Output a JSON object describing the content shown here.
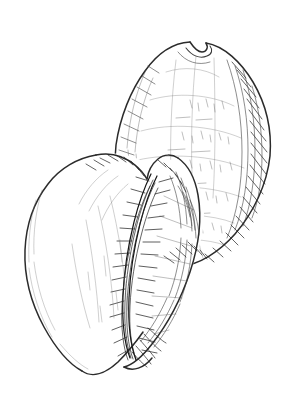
{
  "image": {
    "subject": "two cowrie shells",
    "medium": "pen and ink line drawing",
    "style": "hand-drawn cross-hatched scientific illustration",
    "background_color": "#ffffff",
    "ink_color": "#2b2b2b",
    "width": 293,
    "height": 408,
    "caption": "",
    "signature": ""
  },
  "objects": [
    {
      "name": "upper-shell",
      "label": "dorsal view cowrie shell",
      "position": "upper right",
      "orientation": "tilted, apex toward upper right",
      "features": [
        "notched apex at top",
        "ovate inflated body",
        "dense diagonal cross-hatching along right flank",
        "faint horizontal growth bands across dorsum",
        "narrowed base overlapping lower shell"
      ],
      "bounds": {
        "x": 112,
        "y": 38,
        "width": 162,
        "height": 232
      }
    },
    {
      "name": "lower-shell",
      "label": "ventral view cowrie shell",
      "position": "lower left",
      "orientation": "tilted, aperture facing upper right",
      "features": [
        "long curved aperture slit",
        "toothed denticles flanking the aperture",
        "smooth unmarked left lobe",
        "pointed anterior canal at base",
        "dark shaded columellar margin"
      ],
      "bounds": {
        "x": 22,
        "y": 150,
        "width": 170,
        "height": 230
      }
    }
  ],
  "composition": {
    "arrangement": "two overlapping shells, lower-left shell in front of upper-right shell",
    "shading": "parallel line hatching and cross-hatching, no solid fills",
    "line_weight": "variable, heaviest along contours and aperture"
  }
}
